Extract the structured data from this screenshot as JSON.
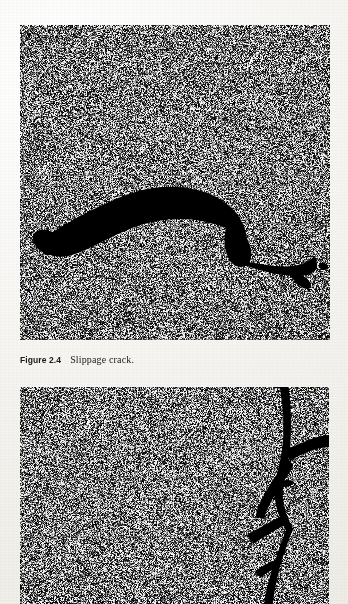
{
  "page": {
    "background_color": "#f4f3ef",
    "width": 348,
    "height": 604
  },
  "figures": [
    {
      "id": "figure-2-4-photo",
      "alt_name": "slippage-crack-photograph",
      "subject": "asphalt pavement surface with slippage crack",
      "frame": {
        "x": 20,
        "y": 25,
        "width": 310,
        "height": 315
      },
      "texture": "high-contrast black and white dithered halftone asphalt aggregate",
      "feature": "large crescent shaped black crack arcing across the middle with tapered tails at left and right"
    },
    {
      "id": "figure-2-5-photo",
      "alt_name": "branching-crack-photograph",
      "subject": "asphalt pavement surface with vertical branching crack",
      "frame": {
        "x": 20,
        "y": 387,
        "width": 309,
        "height": 217
      },
      "texture": "high-contrast black and white dithered halftone asphalt aggregate",
      "feature": "near vertical crack along the right side with short diagonal branches, partially cut off at the bottom of the page"
    }
  ],
  "caption": {
    "label": "Figure 2.4",
    "text": "Slippage crack.",
    "x": 20,
    "y": 350,
    "color": "#1a1a1a"
  }
}
